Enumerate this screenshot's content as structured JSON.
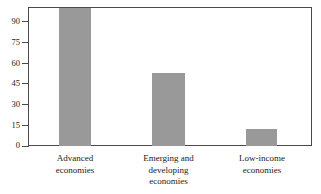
{
  "chart_data": {
    "type": "bar",
    "title": "",
    "subtitle": "",
    "xlabel": "",
    "ylabel": "",
    "categories": [
      "Advanced economies",
      "Emerging and developing economies",
      "Low-income economies"
    ],
    "category_lines": [
      [
        "Advanced",
        "economies"
      ],
      [
        "Emerging and",
        "developing",
        "economies"
      ],
      [
        "Low-income",
        "economies"
      ]
    ],
    "values": [
      96,
      51,
      12
    ],
    "ylim": [
      0,
      97
    ],
    "yticks": [
      0,
      15,
      30,
      45,
      60,
      75,
      90
    ],
    "ytick_labels": [
      "0",
      "15",
      "30",
      "45",
      "60",
      "75",
      "90"
    ],
    "grid": false,
    "legend": false,
    "legend_position": "none",
    "bar_color": "#999999",
    "axis_color": "#4a4a4a",
    "text_color": "#1a1a1a",
    "background_color": "#ffffff"
  }
}
